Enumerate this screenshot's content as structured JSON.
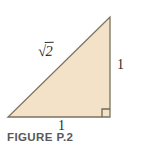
{
  "figure": {
    "caption": "FIGURE P.2",
    "background_color": "#ffffff",
    "shape": {
      "name": "right-triangle",
      "fill_color": "#f3e2c7",
      "stroke_color": "#7a7260",
      "vertices": {
        "bottom_left": [
          8,
          117
        ],
        "bottom_right": [
          110,
          117
        ],
        "top_right": [
          110,
          17
        ]
      },
      "right_angle_marker": {
        "name": "right-angle-marker",
        "corner": "bottom-right",
        "size": 8,
        "stroke_color": "#6f6858"
      }
    },
    "labels": {
      "hypotenuse": {
        "radical": "√",
        "radicand": "2",
        "full_text": "√2"
      },
      "vertical_side": "1",
      "horizontal_side": "1"
    }
  }
}
